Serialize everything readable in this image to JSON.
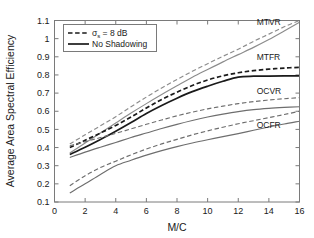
{
  "chart_data": {
    "type": "line",
    "title": "",
    "xlabel": "M/C",
    "ylabel": "Average Area Spectral Efficiency",
    "xlim": [
      0,
      16
    ],
    "ylim": [
      0.1,
      1.1
    ],
    "grid": false,
    "xticks": [
      "0",
      "2",
      "4",
      "6",
      "8",
      "10",
      "12",
      "14",
      "16"
    ],
    "xtick_values": [
      0,
      2,
      4,
      6,
      8,
      10,
      12,
      14,
      16
    ],
    "yticks": [
      "0.1",
      "0.2",
      "0.3",
      "0.4",
      "0.5",
      "0.6",
      "0.7",
      "0.8",
      "0.9",
      "1",
      "1.1"
    ],
    "ytick_values": [
      0.1,
      0.2,
      0.3,
      0.4,
      0.5,
      0.6,
      0.7,
      0.8,
      0.9,
      1.0,
      1.1
    ],
    "legend_position": "upper-left",
    "legend": [
      {
        "label": "σ",
        "sub": "s",
        "rest": " = 8 dB",
        "style": "dashed",
        "color": "#1a1a1a"
      },
      {
        "label": "No Shadowing",
        "sub": "",
        "rest": "",
        "style": "solid",
        "color": "#1a1a1a"
      }
    ],
    "annotations": [
      {
        "text": "MTVR",
        "x": 13.2,
        "y": 1.075
      },
      {
        "text": "MTFR",
        "x": 13.2,
        "y": 0.885
      },
      {
        "text": "OCVR",
        "x": 13.2,
        "y": 0.695
      },
      {
        "text": "OCFR",
        "x": 13.2,
        "y": 0.505
      }
    ],
    "x": [
      1,
      2,
      3,
      4,
      5,
      6,
      7,
      8,
      9,
      10,
      11,
      12,
      13,
      14,
      15,
      16
    ],
    "series": [
      {
        "name": "MTVR σs = 8 dB",
        "group": "MTVR",
        "style": "dashed",
        "color": "#8c8c8c",
        "values": [
          0.42,
          0.47,
          0.52,
          0.57,
          0.625,
          0.678,
          0.728,
          0.775,
          0.82,
          0.862,
          0.903,
          0.942,
          0.985,
          1.025,
          1.065,
          1.1
        ]
      },
      {
        "name": "MTVR No Shadowing",
        "group": "MTVR",
        "style": "solid",
        "color": "#8c8c8c",
        "values": [
          0.37,
          0.425,
          0.48,
          0.535,
          0.59,
          0.642,
          0.692,
          0.74,
          0.787,
          0.83,
          0.872,
          0.912,
          0.952,
          0.995,
          1.042,
          1.09
        ]
      },
      {
        "name": "MTFR σs = 8 dB",
        "group": "MTFR",
        "style": "dashed",
        "color": "#1a1a1a",
        "values": [
          0.4,
          0.44,
          0.48,
          0.522,
          0.568,
          0.618,
          0.665,
          0.705,
          0.742,
          0.772,
          0.795,
          0.812,
          0.824,
          0.832,
          0.838,
          0.842
        ]
      },
      {
        "name": "MTFR No Shadowing",
        "group": "MTFR",
        "style": "solid",
        "color": "#1a1a1a",
        "values": [
          0.362,
          0.402,
          0.445,
          0.49,
          0.538,
          0.588,
          0.632,
          0.672,
          0.708,
          0.738,
          0.765,
          0.788,
          0.793,
          0.794,
          0.795,
          0.795
        ]
      },
      {
        "name": "OCVR σs = 8 dB",
        "group": "OCVR",
        "style": "dashed",
        "color": "#6e6e6e",
        "values": [
          0.41,
          0.432,
          0.455,
          0.478,
          0.503,
          0.528,
          0.552,
          0.575,
          0.595,
          0.613,
          0.628,
          0.642,
          0.653,
          0.662,
          0.669,
          0.675
        ]
      },
      {
        "name": "OCVR No Shadowing",
        "group": "OCVR",
        "style": "solid",
        "color": "#6e6e6e",
        "values": [
          0.345,
          0.375,
          0.402,
          0.428,
          0.455,
          0.48,
          0.505,
          0.528,
          0.549,
          0.568,
          0.584,
          0.598,
          0.609,
          0.616,
          0.621,
          0.625
        ]
      },
      {
        "name": "OCFR σs = 8 dB",
        "group": "OCFR",
        "style": "dashed",
        "color": "#6e6e6e",
        "values": [
          0.19,
          0.245,
          0.29,
          0.325,
          0.36,
          0.392,
          0.42,
          0.445,
          0.47,
          0.492,
          0.512,
          0.531,
          0.548,
          0.565,
          0.582,
          0.6
        ]
      },
      {
        "name": "OCFR No Shadowing",
        "group": "OCFR",
        "style": "solid",
        "color": "#6e6e6e",
        "values": [
          0.15,
          0.2,
          0.252,
          0.3,
          0.33,
          0.358,
          0.383,
          0.405,
          0.425,
          0.443,
          0.46,
          0.477,
          0.495,
          0.513,
          0.53,
          0.545
        ]
      }
    ]
  }
}
